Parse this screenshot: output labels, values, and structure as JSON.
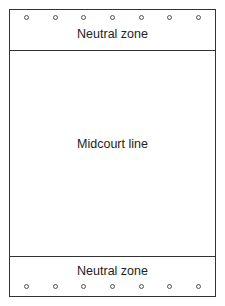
{
  "diagram": {
    "top_zone": {
      "label": "Neutral zone",
      "dot_count": 7
    },
    "middle": {
      "label": "Midcourt line"
    },
    "bottom_zone": {
      "label": "Neutral zone",
      "dot_count": 7
    }
  }
}
